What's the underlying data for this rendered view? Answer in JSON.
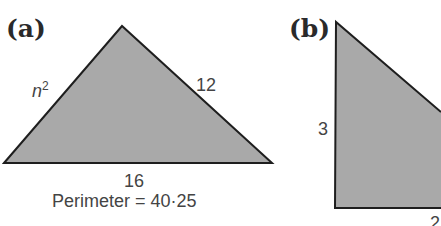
{
  "figure": {
    "fill_color": "#a9a9a9",
    "stroke_color": "#1e1e1e",
    "text_color": "#444444",
    "panels": [
      {
        "id": "a",
        "label": "(a)",
        "shape": "triangle",
        "sides": {
          "left": {
            "base": "n",
            "exponent": "2"
          },
          "right": "12",
          "bottom": "16"
        },
        "caption": "Perimeter = 40·25"
      },
      {
        "id": "b",
        "label": "(b)",
        "shape": "right-triangle (cropped)",
        "sides": {
          "left": "3",
          "bottom": "2"
        }
      }
    ]
  }
}
